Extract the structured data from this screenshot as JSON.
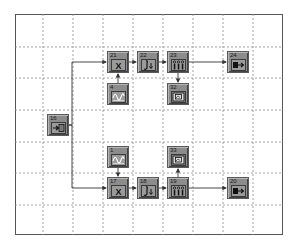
{
  "diagram": {
    "type": "block-diagram",
    "grid": {
      "style": "dashed",
      "color": "#8a8a8a",
      "vertical_lines_x": [
        43,
        73,
        103,
        133,
        163,
        193,
        223,
        253
      ],
      "horizontal_lines_y": [
        47,
        78,
        110,
        142,
        173,
        205
      ]
    },
    "colors": {
      "block_fill": "#8c8c8c",
      "block_border": "#5a5a5a",
      "wire": "#333333",
      "frame": "#555555"
    },
    "blocks": [
      {
        "id": "16",
        "kind": "signal-source-input",
        "icon": "input-arrow-icon",
        "x": 47,
        "y": 114
      },
      {
        "id": "21",
        "kind": "multiplier",
        "icon": "multiply-icon",
        "x": 107,
        "y": 51
      },
      {
        "id": "22",
        "kind": "integrator",
        "icon": "integrator-icon",
        "x": 137,
        "y": 51
      },
      {
        "id": "23",
        "kind": "filter-bank",
        "icon": "bargraph-icon",
        "x": 167,
        "y": 51
      },
      {
        "id": "24",
        "kind": "output",
        "icon": "output-arrow-icon",
        "x": 227,
        "y": 51
      },
      {
        "id": "4",
        "kind": "sine-generator",
        "icon": "sine-wave-icon",
        "x": 107,
        "y": 83
      },
      {
        "id": "32",
        "kind": "display-scope",
        "icon": "scope-icon",
        "x": 167,
        "y": 83
      },
      {
        "id": "1",
        "kind": "sine-generator",
        "icon": "sine-wave-icon",
        "x": 107,
        "y": 146
      },
      {
        "id": "33",
        "kind": "display-scope",
        "icon": "scope-icon",
        "x": 167,
        "y": 146
      },
      {
        "id": "17",
        "kind": "multiplier",
        "icon": "multiply-icon",
        "x": 107,
        "y": 177
      },
      {
        "id": "18",
        "kind": "integrator",
        "icon": "integrator-icon",
        "x": 137,
        "y": 177
      },
      {
        "id": "19",
        "kind": "filter-bank",
        "icon": "bargraph-icon",
        "x": 167,
        "y": 177
      },
      {
        "id": "20",
        "kind": "output",
        "icon": "output-arrow-icon",
        "x": 227,
        "y": 177
      }
    ],
    "connections": [
      {
        "from": "16",
        "to": "21"
      },
      {
        "from": "16",
        "to": "17"
      },
      {
        "from": "4",
        "to": "21"
      },
      {
        "from": "21",
        "to": "22"
      },
      {
        "from": "22",
        "to": "23"
      },
      {
        "from": "23",
        "to": "24"
      },
      {
        "from": "23",
        "to": "32"
      },
      {
        "from": "1",
        "to": "17"
      },
      {
        "from": "17",
        "to": "18"
      },
      {
        "from": "18",
        "to": "19"
      },
      {
        "from": "19",
        "to": "20"
      },
      {
        "from": "19",
        "to": "33"
      }
    ]
  }
}
